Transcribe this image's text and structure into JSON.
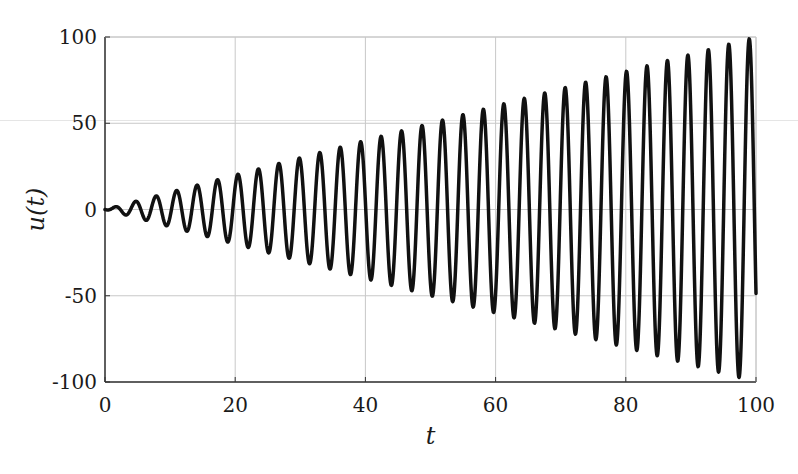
{
  "chart_data": {
    "type": "line",
    "title": "",
    "xlabel": "t",
    "ylabel": "u(t)",
    "xlim": [
      0,
      100
    ],
    "ylim": [
      -100,
      100
    ],
    "grid": true,
    "legend": null,
    "xticks": [
      0,
      20,
      40,
      60,
      80,
      100
    ],
    "yticks": [
      -100,
      -50,
      0,
      50,
      100
    ],
    "xtick_labels": [
      "0",
      "20",
      "40",
      "60",
      "80",
      "100"
    ],
    "ytick_labels": [
      "-100",
      "-50",
      "0",
      "50",
      "100"
    ],
    "series": [
      {
        "name": "u(t)",
        "color": "#111111",
        "line_width": 3.5,
        "description": "Linearly growing oscillation (resonance), approximately u(t) = -t·cos(2t); amplitude ≈ t, period ≈ π",
        "model": {
          "amplitude_slope": 1.0,
          "omega": 2.0,
          "phase": -1.5708
        },
        "sample_step": 0.05,
        "start": {
          "t": 0,
          "u": 0
        },
        "end": {
          "t": 100,
          "u": -48
        },
        "peaks": {
          "t": [
            1.6,
            4.7,
            7.9,
            11.0,
            14.1,
            17.3,
            20.4,
            23.6,
            26.7,
            29.8,
            33.0,
            36.1,
            39.3,
            42.4,
            45.6,
            48.7,
            51.8,
            55.0,
            58.1,
            61.3,
            64.4,
            67.5,
            70.7,
            73.8,
            77.0,
            80.1,
            83.3,
            86.4,
            89.5,
            92.7,
            95.8,
            99.0
          ],
          "u": [
            1.6,
            4.7,
            7.9,
            11.0,
            14.1,
            17.3,
            20.4,
            23.6,
            26.7,
            29.8,
            33.0,
            36.1,
            39.3,
            42.4,
            45.6,
            48.7,
            51.8,
            55.0,
            58.1,
            61.3,
            64.4,
            67.5,
            70.7,
            73.8,
            77.0,
            80.1,
            83.3,
            86.4,
            89.5,
            92.7,
            95.8,
            99.0
          ]
        },
        "troughs": {
          "t": [
            3.1,
            6.3,
            9.4,
            12.6,
            15.7,
            18.8,
            22.0,
            25.1,
            28.3,
            31.4,
            34.6,
            37.7,
            40.8,
            44.0,
            47.1,
            50.3,
            53.4,
            56.5,
            59.7,
            62.8,
            66.0,
            69.1,
            72.3,
            75.4,
            78.5,
            81.7,
            84.8,
            88.0,
            91.1,
            94.2,
            97.4
          ],
          "u": [
            -3.1,
            -6.3,
            -9.4,
            -12.6,
            -15.7,
            -18.8,
            -22.0,
            -25.1,
            -28.3,
            -31.4,
            -34.6,
            -37.7,
            -40.8,
            -44.0,
            -47.1,
            -50.3,
            -53.4,
            -56.5,
            -59.7,
            -62.8,
            -66.0,
            -69.1,
            -72.3,
            -75.4,
            -78.5,
            -81.7,
            -84.8,
            -88.0,
            -91.1,
            -94.2,
            -97.4
          ]
        }
      }
    ]
  },
  "style": {
    "grid_color": "#c8c8c8",
    "axis_color": "#333333",
    "background": "#ffffff"
  },
  "layout": {
    "plot_left": 105,
    "plot_right": 756,
    "plot_top": 37,
    "plot_bottom": 382
  }
}
